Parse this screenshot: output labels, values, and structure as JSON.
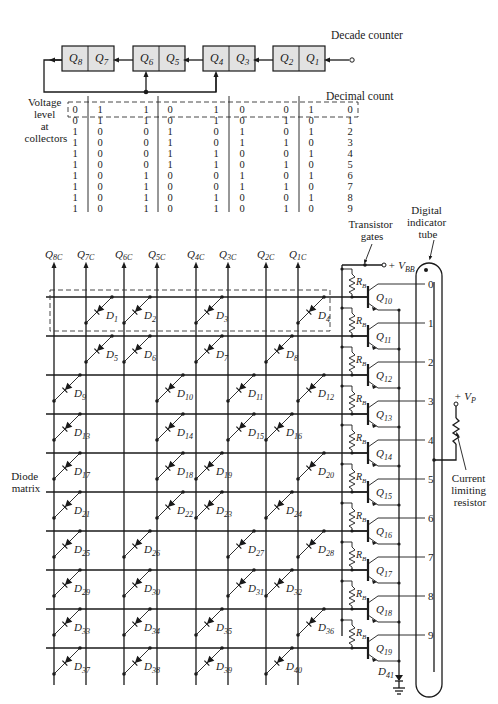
{
  "counter": {
    "title": "Decade counter",
    "flipflops": [
      {
        "left": "Q8",
        "right": "Q7"
      },
      {
        "left": "Q6",
        "right": "Q5"
      },
      {
        "left": "Q4",
        "right": "Q3"
      },
      {
        "left": "Q2",
        "right": "Q1"
      }
    ]
  },
  "truth_table": {
    "row_label": [
      "Voltage",
      "level",
      "at",
      "collectors"
    ],
    "count_label": "Decimal count",
    "rows": [
      {
        "bits": [
          "0",
          "1",
          "1",
          "0",
          "1",
          "0",
          "0",
          "1"
        ],
        "count": "0"
      },
      {
        "bits": [
          "0",
          "1",
          "1",
          "0",
          "1",
          "0",
          "1",
          "0"
        ],
        "count": "1"
      },
      {
        "bits": [
          "1",
          "0",
          "0",
          "1",
          "0",
          "1",
          "0",
          "1"
        ],
        "count": "2"
      },
      {
        "bits": [
          "1",
          "0",
          "0",
          "1",
          "0",
          "1",
          "1",
          "0"
        ],
        "count": "3"
      },
      {
        "bits": [
          "1",
          "0",
          "0",
          "1",
          "1",
          "0",
          "0",
          "1"
        ],
        "count": "4"
      },
      {
        "bits": [
          "1",
          "0",
          "0",
          "1",
          "1",
          "0",
          "1",
          "0"
        ],
        "count": "5"
      },
      {
        "bits": [
          "1",
          "0",
          "1",
          "0",
          "0",
          "1",
          "0",
          "1"
        ],
        "count": "6"
      },
      {
        "bits": [
          "1",
          "0",
          "1",
          "0",
          "0",
          "1",
          "1",
          "0"
        ],
        "count": "7"
      },
      {
        "bits": [
          "1",
          "0",
          "1",
          "0",
          "1",
          "0",
          "0",
          "1"
        ],
        "count": "8"
      },
      {
        "bits": [
          "1",
          "0",
          "1",
          "0",
          "1",
          "0",
          "1",
          "0"
        ],
        "count": "9"
      }
    ]
  },
  "matrix": {
    "label": [
      "Diode",
      "matrix"
    ],
    "columns": [
      "Q8C",
      "Q7C",
      "Q6C",
      "Q5C",
      "Q4C",
      "Q3C",
      "Q2C",
      "Q1C"
    ],
    "diodes": [
      {
        "id": "D1",
        "row": 0,
        "col": 1
      },
      {
        "id": "D2",
        "row": 0,
        "col": 2
      },
      {
        "id": "D3",
        "row": 0,
        "col": 4
      },
      {
        "id": "D4",
        "row": 0,
        "col": 7
      },
      {
        "id": "D5",
        "row": 1,
        "col": 1
      },
      {
        "id": "D6",
        "row": 1,
        "col": 2
      },
      {
        "id": "D7",
        "row": 1,
        "col": 4
      },
      {
        "id": "D8",
        "row": 1,
        "col": 6
      },
      {
        "id": "D9",
        "row": 2,
        "col": 0
      },
      {
        "id": "D10",
        "row": 2,
        "col": 3
      },
      {
        "id": "D11",
        "row": 2,
        "col": 5
      },
      {
        "id": "D12",
        "row": 2,
        "col": 7
      },
      {
        "id": "D13",
        "row": 3,
        "col": 0
      },
      {
        "id": "D14",
        "row": 3,
        "col": 3
      },
      {
        "id": "D15",
        "row": 3,
        "col": 5
      },
      {
        "id": "D16",
        "row": 3,
        "col": 6
      },
      {
        "id": "D17",
        "row": 4,
        "col": 0
      },
      {
        "id": "D18",
        "row": 4,
        "col": 3
      },
      {
        "id": "D19",
        "row": 4,
        "col": 4
      },
      {
        "id": "D20",
        "row": 4,
        "col": 7
      },
      {
        "id": "D21",
        "row": 5,
        "col": 0
      },
      {
        "id": "D22",
        "row": 5,
        "col": 3
      },
      {
        "id": "D23",
        "row": 5,
        "col": 4
      },
      {
        "id": "D24",
        "row": 5,
        "col": 6
      },
      {
        "id": "D25",
        "row": 6,
        "col": 0
      },
      {
        "id": "D26",
        "row": 6,
        "col": 2
      },
      {
        "id": "D27",
        "row": 6,
        "col": 5
      },
      {
        "id": "D28",
        "row": 6,
        "col": 7
      },
      {
        "id": "D29",
        "row": 7,
        "col": 0
      },
      {
        "id": "D30",
        "row": 7,
        "col": 2
      },
      {
        "id": "D31",
        "row": 7,
        "col": 5
      },
      {
        "id": "D32",
        "row": 7,
        "col": 6
      },
      {
        "id": "D33",
        "row": 8,
        "col": 0
      },
      {
        "id": "D34",
        "row": 8,
        "col": 2
      },
      {
        "id": "D35",
        "row": 8,
        "col": 4
      },
      {
        "id": "D36",
        "row": 8,
        "col": 7
      },
      {
        "id": "D37",
        "row": 9,
        "col": 0
      },
      {
        "id": "D38",
        "row": 9,
        "col": 2
      },
      {
        "id": "D39",
        "row": 9,
        "col": 4
      },
      {
        "id": "D40",
        "row": 9,
        "col": 6
      }
    ]
  },
  "gates": {
    "label": [
      "Transistor",
      "gates"
    ],
    "supply": "+ V",
    "supply_sub": "BB",
    "resistor": "R",
    "resistor_sub": "B",
    "transistors": [
      "Q10",
      "Q11",
      "Q12",
      "Q13",
      "Q14",
      "Q15",
      "Q16",
      "Q17",
      "Q18",
      "Q19"
    ],
    "ground_diode": "D41"
  },
  "tube": {
    "label": [
      "Digital",
      "indicator",
      "tube"
    ],
    "digits": [
      "0",
      "1",
      "2",
      "3",
      "4",
      "5",
      "6",
      "7",
      "8",
      "9"
    ]
  },
  "plate": {
    "supply": "+ V",
    "supply_sub": "P",
    "resistor_label": [
      "Current",
      "limiting",
      "resistor"
    ]
  }
}
